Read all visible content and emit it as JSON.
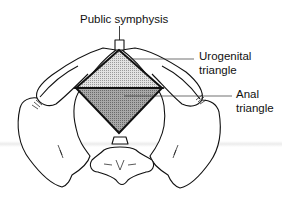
{
  "diagram": {
    "labels": {
      "top": "Public symphysis",
      "urogenital": [
        "Urogenital",
        "triangle"
      ],
      "anal": [
        "Anal",
        "triangle"
      ]
    },
    "colors": {
      "line": "#111111",
      "urogenital_fill": "#d2d2d2",
      "anal_fill": "#9a9a9a",
      "background": "#ffffff"
    }
  }
}
